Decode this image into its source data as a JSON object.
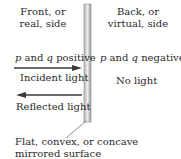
{
  "front": {
    "line1": "Front, or",
    "line2": "real, side"
  },
  "back": {
    "line1": "Back, or",
    "line2": "virtual, side"
  },
  "front_sign": {
    "p": "p",
    "and": " and ",
    "q": "q",
    "rest": " positive"
  },
  "back_sign": {
    "p": "p",
    "and": " and ",
    "q": "q",
    "rest": " negative"
  },
  "incident": "Incident light",
  "reflected": "Reflected light",
  "no_light": "No light",
  "surface": {
    "line1": "Flat, convex, or concave",
    "line2": "mirrored surface"
  },
  "colors": {
    "mirror_light": "#e6e6e6",
    "mirror_dark": "#9a9a9a",
    "arrow": "#3a3a3a"
  }
}
